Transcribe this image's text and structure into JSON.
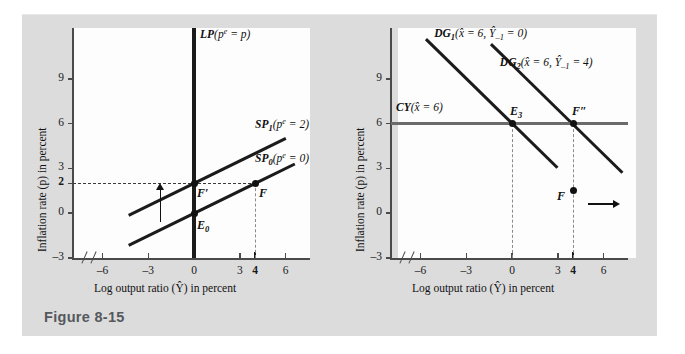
{
  "figure": {
    "caption": "Figure 8-15",
    "panels": [
      {
        "id": "left",
        "axis": {
          "xlabel_pre": "Log output ratio (",
          "xlabel_var": "Ŷ",
          "xlabel_post": ") in percent",
          "ylabel_pre": "Inflation rate (",
          "ylabel_var": "p",
          "ylabel_post": ") in percent",
          "xticks": [
            "–6",
            "–3",
            "0",
            "3",
            "4",
            "6"
          ],
          "xtick_values": [
            -6,
            -3,
            0,
            3,
            4,
            6
          ],
          "xtick_bold": [
            false,
            false,
            false,
            false,
            true,
            false
          ],
          "yticks": [
            "9",
            "6",
            "3",
            "2",
            "0",
            "–3"
          ],
          "ytick_values": [
            9,
            6,
            3,
            2,
            0,
            -3
          ],
          "ytick_bold": [
            false,
            false,
            false,
            true,
            false,
            false
          ],
          "xlim": [
            -8,
            7.6
          ],
          "ylim": [
            -3,
            12.4
          ]
        },
        "curves": [
          {
            "name": "LP",
            "label_main": "LP",
            "label_paren": "(",
            "label_p": "p",
            "label_sup": "e",
            "label_eq": " = ",
            "label_val": "p",
            "label_close": ")",
            "type": "vertical",
            "x": 0
          },
          {
            "name": "SP1",
            "label_main": "SP",
            "label_sub": "1",
            "label_paren": "(",
            "label_p": "p",
            "label_sup": "e",
            "label_eq": " = ",
            "label_val": "2",
            "label_close": ")",
            "type": "line",
            "slope": 0.5,
            "intercept": 2
          },
          {
            "name": "SP0",
            "label_main": "SP",
            "label_sub": "0",
            "label_paren": "(",
            "label_p": "p",
            "label_sup": "e",
            "label_eq": " = ",
            "label_val": "0",
            "label_close": ")",
            "type": "line",
            "slope": 0.5,
            "intercept": 0
          }
        ],
        "points": [
          {
            "name": "F-prime",
            "label": "F",
            "prime": "′",
            "x": 0,
            "y": 2
          },
          {
            "name": "E0",
            "label": "E",
            "sub": "0",
            "x": 0,
            "y": 0
          },
          {
            "name": "F",
            "label": "F",
            "x": 4,
            "y": 2
          }
        ],
        "guides": [
          {
            "name": "inflation-2-guide",
            "type": "horizontal-dashed",
            "y": 2
          },
          {
            "name": "output-4-guide",
            "type": "vertical-dashed",
            "x": 4
          }
        ],
        "arrows": [
          {
            "name": "sp-shift-up-arrow",
            "direction": "up",
            "x": -2.2,
            "y_from": -0.6,
            "y_to": 1.6
          }
        ]
      },
      {
        "id": "right",
        "axis": {
          "xlabel_pre": "Log output ratio (",
          "xlabel_var": "Ŷ",
          "xlabel_post": ") in percent",
          "ylabel_pre": "Inflation rate (",
          "ylabel_var": "p",
          "ylabel_post": ") in percent",
          "xticks": [
            "–6",
            "–3",
            "0",
            "3",
            "4",
            "6"
          ],
          "xtick_values": [
            -6,
            -3,
            0,
            3,
            4,
            6
          ],
          "xtick_bold": [
            false,
            false,
            false,
            false,
            true,
            false
          ],
          "yticks": [
            "9",
            "6",
            "3",
            "0",
            "–3"
          ],
          "ytick_values": [
            9,
            6,
            3,
            0,
            -3
          ],
          "ytick_bold": [
            false,
            false,
            false,
            false,
            false
          ],
          "xlim": [
            -8,
            7.6
          ],
          "ylim": [
            -3,
            12.4
          ]
        },
        "curves": [
          {
            "name": "DG1",
            "label_main": "DG",
            "label_sub": "1",
            "label_open": "(",
            "label_x": "x̂",
            "label_eq1": " = ",
            "label_v1": "6",
            "label_comma": ", ",
            "label_y": "Ŷ",
            "label_ysub": "–1",
            "label_eq2": " = ",
            "label_v2": "0",
            "label_close": ")",
            "type": "line",
            "slope": -1.0,
            "intercept": 6
          },
          {
            "name": "DG2",
            "label_main": "DG",
            "label_sub": "2",
            "label_open": "(",
            "label_x": "x̂",
            "label_eq1": " = ",
            "label_v1": "6",
            "label_comma": ", ",
            "label_y": "Ŷ",
            "label_ysub": "–1",
            "label_eq2": " = ",
            "label_v2": "4",
            "label_close": ")",
            "type": "line",
            "slope": -1.0,
            "intercept": 10
          },
          {
            "name": "CY",
            "label_main": "CY",
            "label_open": "(",
            "label_x": "x̂",
            "label_eq1": " = ",
            "label_v1": "6",
            "label_close": ")",
            "type": "horizontal",
            "y": 6
          }
        ],
        "points": [
          {
            "name": "E3",
            "label": "E",
            "sub": "3",
            "x": 0,
            "y": 6
          },
          {
            "name": "F-double-prime",
            "label": "F",
            "prime": "″",
            "x": 4,
            "y": 6
          },
          {
            "name": "F",
            "label": "F",
            "x": 4,
            "y": 1.5
          }
        ],
        "guides": [
          {
            "name": "output-0-guide",
            "type": "vertical-dashed",
            "x": 0
          },
          {
            "name": "output-4-guide",
            "type": "vertical-dashed",
            "x": 4
          }
        ],
        "arrows": [
          {
            "name": "dg-shift-right-arrow",
            "direction": "right",
            "x_from": 5.0,
            "x_to": 6.7,
            "y": 0.6
          }
        ]
      }
    ]
  },
  "chart_data": {
    "type": "line",
    "title": "Figure 8-15",
    "xlabel": "Log output ratio (Ŷ) in percent",
    "ylabel": "Inflation rate (p) in percent",
    "xlim": [
      -8,
      7.6
    ],
    "ylim": [
      -3,
      12.4
    ],
    "grid": false,
    "panels": [
      {
        "panel": "left",
        "series": [
          {
            "name": "LP (pᵉ = p)",
            "type": "vertical-line",
            "x": 0
          },
          {
            "name": "SP₁ (pᵉ = 2)",
            "type": "line",
            "slope": 0.5,
            "intercept": 2,
            "points": [
              {
                "x": -4.3,
                "y": -0.15
              },
              {
                "x": 6.0,
                "y": 5.0
              }
            ]
          },
          {
            "name": "SP₀ (pᵉ = 0)",
            "type": "line",
            "slope": 0.5,
            "intercept": 0,
            "points": [
              {
                "x": -4.3,
                "y": -2.15
              },
              {
                "x": 6.6,
                "y": 3.3
              }
            ]
          }
        ],
        "annotated_points": [
          {
            "label": "F′",
            "x": 0,
            "y": 2
          },
          {
            "label": "E₀",
            "x": 0,
            "y": 0
          },
          {
            "label": "F",
            "x": 4,
            "y": 2
          }
        ],
        "xticks": [
          -6,
          -3,
          0,
          3,
          4,
          6
        ],
        "yticks": [
          9,
          6,
          3,
          2,
          0,
          -3
        ]
      },
      {
        "panel": "right",
        "series": [
          {
            "name": "DG₁ (x̂ = 6, Ŷ₋₁ = 0)",
            "type": "line",
            "slope": -1.0,
            "intercept": 6,
            "points": [
              {
                "x": -5.6,
                "y": 11.6
              },
              {
                "x": 3.0,
                "y": 3.0
              }
            ]
          },
          {
            "name": "DG₂ (x̂ = 6, Ŷ₋₁ = 4)",
            "type": "line",
            "slope": -1.0,
            "intercept": 10,
            "points": [
              {
                "x": -1.3,
                "y": 11.3
              },
              {
                "x": 7.3,
                "y": 2.7
              }
            ]
          },
          {
            "name": "CY (x̂ = 6)",
            "type": "horizontal-line",
            "y": 6
          }
        ],
        "annotated_points": [
          {
            "label": "E₃",
            "x": 0,
            "y": 6
          },
          {
            "label": "F″",
            "x": 4,
            "y": 6
          },
          {
            "label": "F",
            "x": 4,
            "y": 1.5
          }
        ],
        "xticks": [
          -6,
          -3,
          0,
          3,
          4,
          6
        ],
        "yticks": [
          9,
          6,
          3,
          0,
          -3
        ]
      }
    ]
  },
  "colors": {
    "mount": "#dcdcdc",
    "canvas": "#fdfdfd",
    "curve": "#1b1b1b",
    "cy_curve": "#6b6b6b",
    "axis": "#4a4a4a",
    "caption_text": "#55585c"
  }
}
